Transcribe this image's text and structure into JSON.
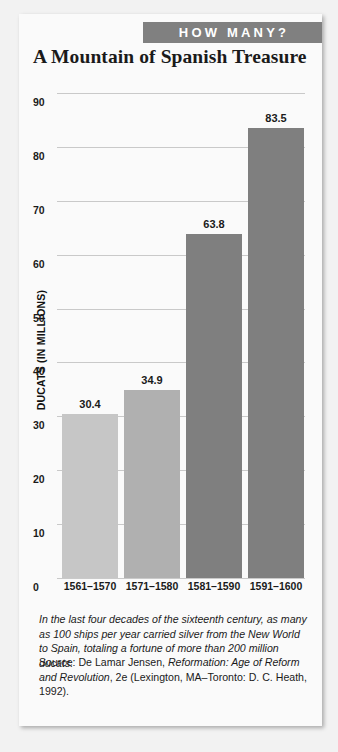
{
  "banner": {
    "label": "HOW MANY?",
    "bg_color": "#808080",
    "text_color": "#ffffff"
  },
  "title": "A Mountain of Spanish Treasure",
  "caption": "In the last four decades of the sixteenth century, as many as 100 ships per year carried silver from the New World to Spain, totaling a fortune of more than 200 million ducats.",
  "source": {
    "prefix": "Source: De Lamar Jensen, ",
    "work_italic": "Reformation: Age of Reform and Revolution",
    "suffix": ", 2e (Lexington, MA–Toronto: D. C. Heath, 1992)."
  },
  "chart_data": {
    "type": "bar",
    "title": "A Mountain of Spanish Treasure",
    "xlabel": "",
    "ylabel": "DUCATS (IN MILLIONS)",
    "categories": [
      "1561–1570",
      "1571–1580",
      "1581–1590",
      "1591–1600"
    ],
    "values": [
      30.4,
      34.9,
      63.8,
      83.5
    ],
    "value_labels": [
      "30.4",
      "34.9",
      "63.8",
      "83.5"
    ],
    "bar_colors": [
      "#c6c6c6",
      "#b0b0b0",
      "#7f7f7f",
      "#7f7f7f"
    ],
    "ylim": [
      0,
      90
    ],
    "yticks": [
      0,
      10,
      20,
      30,
      40,
      50,
      60,
      70,
      80,
      90
    ],
    "ytick_labels": [
      "0",
      "10",
      "20",
      "30",
      "40",
      "50",
      "60",
      "70",
      "80",
      "90"
    ],
    "grid": true,
    "gridline_color": "#c9c9c9",
    "legend": "none"
  }
}
